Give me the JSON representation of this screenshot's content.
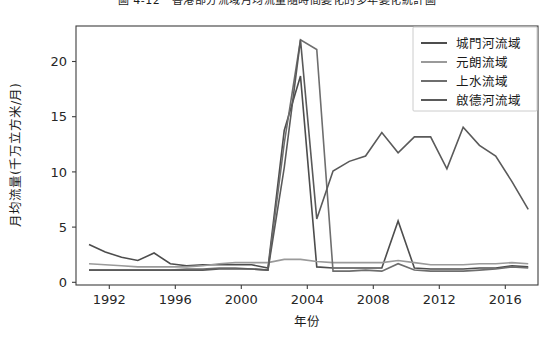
{
  "figure": {
    "title": "圖 4-12　香港部分流域月均流量隨時間變化的多年變化統計圖",
    "background": "#ffffff"
  },
  "chart_data": {
    "type": "line",
    "title": "圖 4-12　香港部分流域月均流量隨時間變化的多年變化統計圖",
    "xlabel": "年份",
    "ylabel": "月均流量(千万立方米/月)",
    "xlim": [
      1989.2,
      2017.6
    ],
    "ylim": [
      -1.1,
      23.2
    ],
    "xticks": [
      1992,
      1996,
      2000,
      2004,
      2008,
      2012,
      2016
    ],
    "yticks": [
      0,
      5,
      10,
      15,
      20
    ],
    "grid": false,
    "legend_position": "upper right",
    "x": [
      1990,
      1991,
      1992,
      1993,
      1994,
      1995,
      1996,
      1997,
      1998,
      1999,
      2000,
      2001,
      2002,
      2003,
      2004,
      2005,
      2006,
      2007,
      2008,
      2009,
      2010,
      2011,
      2012,
      2013,
      2014,
      2015,
      2016,
      2017
    ],
    "series": [
      {
        "name": "城門河流域",
        "color": "#4d4d4d",
        "linewidth": 1.6,
        "values": [
          2.7,
          2.0,
          1.5,
          1.2,
          1.9,
          0.9,
          0.7,
          0.8,
          0.8,
          0.8,
          0.8,
          0.5,
          13.4,
          18.5,
          0.6,
          0.5,
          0.5,
          0.5,
          0.5,
          4.9,
          0.5,
          0.4,
          0.4,
          0.4,
          0.5,
          0.5,
          0.7,
          0.6
        ]
      },
      {
        "name": "元朗流域",
        "color": "#9a9a9a",
        "linewidth": 1.6,
        "values": [
          0.9,
          0.8,
          0.7,
          0.6,
          0.6,
          0.6,
          0.6,
          0.7,
          0.9,
          1.0,
          1.0,
          1.0,
          1.3,
          1.3,
          1.1,
          1.0,
          1.0,
          1.0,
          1.0,
          1.2,
          1.0,
          0.8,
          0.8,
          0.8,
          0.9,
          0.9,
          1.0,
          0.9
        ]
      },
      {
        "name": "上水流域",
        "color": "#6e6e6e",
        "linewidth": 1.6,
        "values": [
          0.3,
          0.3,
          0.3,
          0.3,
          0.3,
          0.3,
          0.4,
          0.4,
          0.5,
          0.5,
          0.4,
          0.3,
          12.2,
          21.9,
          21.0,
          0.2,
          0.2,
          0.3,
          0.2,
          0.9,
          0.3,
          0.2,
          0.2,
          0.2,
          0.3,
          0.4,
          0.6,
          0.5
        ]
      },
      {
        "name": "啟德河流域",
        "color": "#5a5a5a",
        "linewidth": 1.6,
        "values": [
          0.3,
          0.3,
          0.3,
          0.3,
          0.3,
          0.3,
          0.3,
          0.3,
          0.4,
          0.4,
          0.4,
          0.3,
          9.9,
          21.9,
          5.1,
          9.6,
          10.5,
          11.0,
          13.2,
          11.3,
          12.8,
          12.8,
          9.8,
          13.7,
          12.0,
          11.0,
          8.6,
          6.0
        ]
      }
    ],
    "legend_entries": [
      "城門河流域",
      "元朗流域",
      "上水流域",
      "啟德河流域"
    ]
  }
}
